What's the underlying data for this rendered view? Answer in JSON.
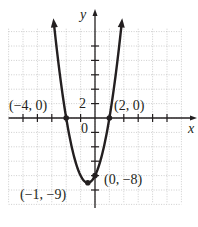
{
  "chart_data": {
    "type": "line",
    "title": "",
    "xlabel": "x",
    "ylabel": "y",
    "function": "y = x^2 + 2x - 8",
    "xlim": [
      -12,
      12
    ],
    "ylim": [
      -12,
      12
    ],
    "grid": true,
    "grid_spacing": 2,
    "tick_labels": [
      {
        "axis": "y",
        "value": 2,
        "text": "2"
      },
      {
        "axis": "origin",
        "value": 0,
        "text": "0"
      }
    ],
    "series": [
      {
        "name": "parabola",
        "color": "#231f20",
        "x_range": [
          -5.7,
          3.7
        ],
        "arrows": "both-ends-up"
      }
    ],
    "points": [
      {
        "x": -4,
        "y": 0,
        "label": "(−4, 0)"
      },
      {
        "x": 2,
        "y": 0,
        "label": "(2, 0)"
      },
      {
        "x": -1,
        "y": -9,
        "label": "(−1, −9)"
      },
      {
        "x": 0,
        "y": -8,
        "label": "(0, −8)"
      }
    ]
  },
  "labels": {
    "x_axis": "x",
    "y_axis": "y",
    "tick_two": "2",
    "origin": "0",
    "pt_left_root": "(−4, 0)",
    "pt_right_root": "(2, 0)",
    "pt_vertex": "(−1, −9)",
    "pt_y_intercept": "(0, −8)"
  },
  "colors": {
    "curve": "#231f20",
    "axes": "#231f20",
    "grid": "#b8b8b8"
  }
}
